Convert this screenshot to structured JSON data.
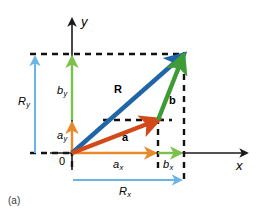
{
  "figure": {
    "caption": "(a)",
    "axes": {
      "x_label": "x",
      "y_label": "y",
      "origin_label": "0"
    },
    "vectors": [
      {
        "name": "a",
        "label": "a",
        "color": "#d2491a",
        "from": [
          72,
          153
        ],
        "to": [
          158,
          120
        ],
        "description": "vector a drawn from origin"
      },
      {
        "name": "b",
        "label": "b",
        "color": "#3d9c35",
        "from": [
          158,
          120
        ],
        "to": [
          184,
          54
        ],
        "description": "vector b drawn from tip of a"
      },
      {
        "name": "R",
        "label": "R",
        "color": "#2065a8",
        "from": [
          72,
          153
        ],
        "to": [
          184,
          54
        ],
        "description": "resultant vector R from origin to tip of b"
      }
    ],
    "components": [
      {
        "name": "a_x",
        "base": "a",
        "subscript": "x",
        "color": "#e8892b",
        "orientation": "horizontal",
        "from": [
          72,
          153
        ],
        "to": [
          158,
          153
        ]
      },
      {
        "name": "b_x",
        "base": "b",
        "subscript": "x",
        "color": "#7cc24a",
        "orientation": "horizontal",
        "from": [
          158,
          153
        ],
        "to": [
          184,
          153
        ]
      },
      {
        "name": "R_x",
        "base": "R",
        "subscript": "x",
        "color": "#6cb4e4",
        "orientation": "horizontal",
        "from": [
          72,
          180
        ],
        "to": [
          184,
          180
        ]
      },
      {
        "name": "a_y",
        "base": "a",
        "subscript": "y",
        "color": "#e8892b",
        "orientation": "vertical",
        "from": [
          72,
          153
        ],
        "to": [
          72,
          120
        ]
      },
      {
        "name": "b_y",
        "base": "b",
        "subscript": "y",
        "color": "#7cc24a",
        "orientation": "vertical",
        "from": [
          72,
          120
        ],
        "to": [
          72,
          54
        ]
      },
      {
        "name": "R_y",
        "base": "R",
        "subscript": "y",
        "color": "#6cb4e4",
        "orientation": "vertical",
        "from": [
          35,
          153
        ],
        "to": [
          35,
          54
        ]
      }
    ],
    "guides": [
      {
        "name": "top-horizontal-dashed",
        "from": [
          30,
          54
        ],
        "to": [
          186,
          54
        ]
      },
      {
        "name": "mid-horizontal-dashed",
        "from": [
          104,
          120
        ],
        "to": [
          170,
          120
        ]
      },
      {
        "name": "origin-left-dashed",
        "from": [
          30,
          153
        ],
        "to": [
          72,
          153
        ]
      },
      {
        "name": "a-tip-vertical-dashed",
        "from": [
          158,
          118
        ],
        "to": [
          158,
          168
        ]
      },
      {
        "name": "right-vertical-dashed",
        "from": [
          184,
          54
        ],
        "to": [
          184,
          182
        ]
      },
      {
        "name": "y-axis-vertical-dashed",
        "from": [
          72,
          153
        ],
        "to": [
          72,
          168
        ]
      }
    ],
    "colors": {
      "vector_a": "#d2491a",
      "vector_b": "#3d9c35",
      "vector_R": "#2065a8",
      "component_a": "#e8892b",
      "component_b": "#7cc24a",
      "component_R": "#6cb4e4",
      "axis": "#1a1a1a",
      "dashed_guide": "#111111",
      "background": "#ffffff"
    }
  }
}
